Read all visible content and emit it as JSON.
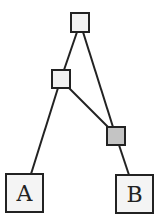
{
  "diagram": {
    "type": "tree",
    "nodes": [
      {
        "id": "root",
        "label": "",
        "x": 71,
        "y": 13,
        "w": 18,
        "h": 19,
        "fill": "#f2f2f2"
      },
      {
        "id": "mid",
        "label": "",
        "x": 52,
        "y": 70,
        "w": 18,
        "h": 18,
        "fill": "#f2f2f2"
      },
      {
        "id": "gray",
        "label": "",
        "x": 107,
        "y": 127,
        "w": 18,
        "h": 18,
        "fill": "#c4c4c4"
      },
      {
        "id": "A",
        "label": "A",
        "x": 6,
        "y": 174,
        "w": 37,
        "h": 38,
        "fill": "#f4f4f4"
      },
      {
        "id": "B",
        "label": "B",
        "x": 116,
        "y": 175,
        "w": 37,
        "h": 38,
        "fill": "#f4f4f4"
      }
    ],
    "edges": [
      {
        "from": "root",
        "to": "mid",
        "x1": 77,
        "y1": 32,
        "x2": 64,
        "y2": 70
      },
      {
        "from": "root",
        "to": "gray",
        "x1": 83,
        "y1": 32,
        "x2": 113,
        "y2": 127
      },
      {
        "from": "mid",
        "to": "gray",
        "x1": 69,
        "y1": 88,
        "x2": 109,
        "y2": 128
      },
      {
        "from": "mid",
        "to": "A",
        "x1": 58,
        "y1": 88,
        "x2": 31,
        "y2": 174
      },
      {
        "from": "gray",
        "to": "B",
        "x1": 119,
        "y1": 145,
        "x2": 129,
        "y2": 175
      }
    ],
    "colors": {
      "stroke": "#222222",
      "background": "#ffffff"
    }
  }
}
